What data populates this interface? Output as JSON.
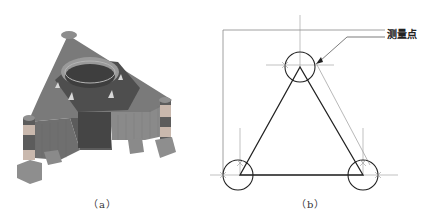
{
  "figure": {
    "panels": [
      {
        "id": "a",
        "caption": "（a）",
        "content": "3D model of triangular base with central cylindrical ring and three corner posts on support blocks",
        "colors": {
          "body_top": "#7a7a7a",
          "body_dark": "#4a4a4a",
          "ring": "#9a9a9a",
          "ring_inner": "#3e3e3e",
          "post_light": "#c9b8ad",
          "post_dark": "#585858",
          "block": "#8e8e8e"
        }
      },
      {
        "id": "b",
        "caption": "（b）",
        "callout_label": "测量点",
        "content": "Schematic triangle with circles at three vertices, crosshair reference lines and measurement point leader",
        "colors": {
          "line_dark": "#222222",
          "line_gray": "#888888"
        }
      }
    ]
  }
}
